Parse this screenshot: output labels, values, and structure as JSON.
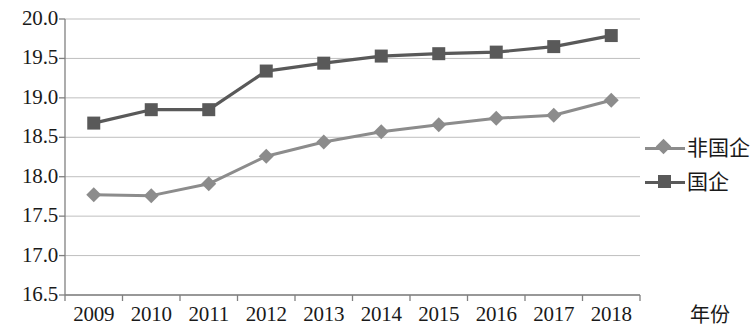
{
  "chart_data": {
    "type": "line",
    "title": "",
    "xlabel": "年份",
    "ylabel": "",
    "categories": [
      "2009",
      "2010",
      "2011",
      "2012",
      "2013",
      "2014",
      "2015",
      "2016",
      "2017",
      "2018"
    ],
    "series": [
      {
        "name": "非国企",
        "marker": "diamond",
        "color": "#8c8c8c",
        "values": [
          17.77,
          17.76,
          17.91,
          18.26,
          18.44,
          18.57,
          18.66,
          18.74,
          18.78,
          18.97
        ]
      },
      {
        "name": "国企",
        "marker": "square",
        "color": "#595959",
        "values": [
          18.68,
          18.85,
          18.85,
          19.34,
          19.44,
          19.53,
          19.56,
          19.58,
          19.65,
          19.79
        ]
      }
    ],
    "ylim": [
      16.5,
      20.0
    ],
    "y_ticks": [
      "16.5",
      "17.0",
      "17.5",
      "18.0",
      "18.5",
      "19.0",
      "19.5",
      "20.0"
    ],
    "y_tick_values": [
      16.5,
      17.0,
      17.5,
      18.0,
      18.5,
      19.0,
      19.5,
      20.0
    ],
    "grid": true,
    "grid_color": "#bfbfbf",
    "axis_color": "#808080",
    "legend_position": "right"
  }
}
